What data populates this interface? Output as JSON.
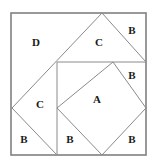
{
  "figure": {
    "kind": "geometric-dissection-diagram",
    "canvas": {
      "width": 153,
      "height": 162
    },
    "colors": {
      "background": "#ffffff",
      "outer_border": "#808080",
      "inner_line": "#8a8a8a",
      "label_text": "#1a1a1a"
    },
    "outer_square": {
      "name": "outer-square",
      "x": 11,
      "y": 13,
      "width": 135,
      "height": 142,
      "stroke_width": 1.6
    },
    "polylines": [
      {
        "name": "large-diamond-upper-left-side",
        "points": "102,13 12,108"
      },
      {
        "name": "large-diamond-lower-left-side",
        "points": "12,108 57,155"
      },
      {
        "name": "large-diamond-upper-right-side",
        "points": "102,13 146,62"
      },
      {
        "name": "horizontal-divider",
        "points": "57,62 146,62"
      },
      {
        "name": "vertical-divider",
        "points": "57,62 57,155"
      },
      {
        "name": "inner-diamond-upper-left-side",
        "points": "113,62 57,108"
      },
      {
        "name": "inner-diamond-lower-left-side",
        "points": "57,108 102,155"
      },
      {
        "name": "inner-diamond-upper-right-side",
        "points": "113,62 146,108"
      },
      {
        "name": "inner-diamond-lower-right-side",
        "points": "146,108 102,155"
      }
    ],
    "labels": [
      {
        "name": "region-label-d",
        "text": "D",
        "x": 36,
        "y": 43
      },
      {
        "name": "region-label-c-top",
        "text": "C",
        "x": 99,
        "y": 43
      },
      {
        "name": "region-label-b-top-right",
        "text": "B",
        "x": 132,
        "y": 31
      },
      {
        "name": "region-label-b-right",
        "text": "B",
        "x": 132,
        "y": 76
      },
      {
        "name": "region-label-a",
        "text": "A",
        "x": 97,
        "y": 100
      },
      {
        "name": "region-label-c-left",
        "text": "C",
        "x": 40,
        "y": 105
      },
      {
        "name": "region-label-b-bottom-left",
        "text": "B",
        "x": 24,
        "y": 140
      },
      {
        "name": "region-label-b-bottom-middle",
        "text": "B",
        "x": 70,
        "y": 140
      },
      {
        "name": "region-label-b-bottom-right",
        "text": "B",
        "x": 132,
        "y": 140
      }
    ]
  }
}
